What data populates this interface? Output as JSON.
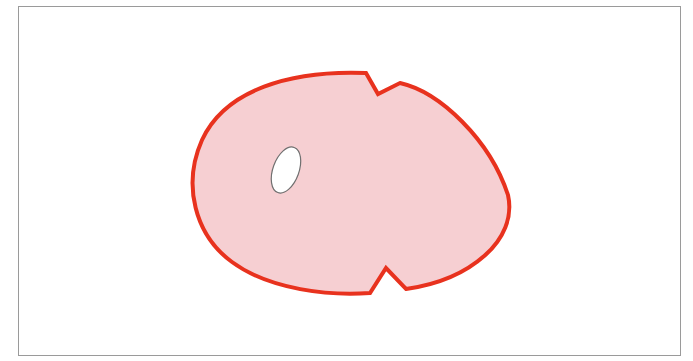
{
  "diagram": {
    "type": "shape-illustration",
    "colors": {
      "frame_border": "#9a9a9a",
      "shape_fill": "#f6cfd2",
      "shape_stroke": "#e8321e",
      "hole_fill": "#ffffff",
      "hole_stroke": "#707070",
      "background": "#ffffff"
    },
    "shape": {
      "notches": [
        {
          "position": "top",
          "points": [
            [
              366,
              73
            ],
            [
              378,
              94
            ],
            [
              400,
              83
            ]
          ]
        },
        {
          "position": "bottom",
          "points": [
            [
              370,
              293
            ],
            [
              386,
              268
            ],
            [
              406,
              289
            ]
          ]
        }
      ],
      "extents": {
        "left": 190,
        "right": 510,
        "top": 72,
        "bottom": 294
      }
    },
    "hole": {
      "cx": 286,
      "cy": 170,
      "rx": 13,
      "ry": 24,
      "rotation_deg": 20
    }
  }
}
